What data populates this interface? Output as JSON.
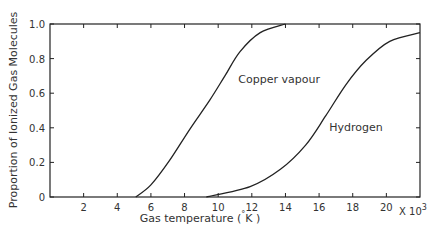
{
  "chart_data": {
    "type": "line",
    "title": "",
    "xlabel": "Gas temperature (°K)",
    "xlabel_parts": {
      "main": "Gas   temperature (",
      "degree": "°",
      "unit": "K )"
    },
    "x_multiplier": "X 10",
    "x_multiplier_exp": "3",
    "ylabel": "Proportion of Ionized Gas Molecules",
    "xlim": [
      0,
      22
    ],
    "ylim": [
      0,
      1.0
    ],
    "x_ticks": [
      2,
      4,
      6,
      8,
      10,
      12,
      14,
      16,
      18,
      20
    ],
    "x_tick_labels": [
      "2",
      "4",
      "6",
      "8",
      "10",
      "12",
      "14",
      "16",
      "18",
      "20"
    ],
    "y_ticks": [
      0,
      0.2,
      0.4,
      0.6,
      0.8,
      1.0
    ],
    "y_tick_labels": [
      "0",
      "0.2",
      "0.4",
      "0.6",
      "0.8",
      "1.0"
    ],
    "grid": false,
    "legend": "inline labels",
    "series": [
      {
        "name": "Copper vapour",
        "label_pos": {
          "x": 11.2,
          "y": 0.66
        },
        "x": [
          5.1,
          6.0,
          7.1,
          8.3,
          9.5,
          10.4,
          11.3,
          12.5,
          14.0
        ],
        "y": [
          0.0,
          0.07,
          0.21,
          0.39,
          0.56,
          0.7,
          0.84,
          0.95,
          1.0
        ]
      },
      {
        "name": "Hydrogen",
        "label_pos": {
          "x": 16.6,
          "y": 0.38
        },
        "x": [
          9.3,
          11.9,
          13.7,
          15.2,
          16.4,
          17.6,
          18.8,
          20.2,
          22.0
        ],
        "y": [
          0.0,
          0.06,
          0.16,
          0.3,
          0.47,
          0.65,
          0.79,
          0.9,
          0.95
        ]
      }
    ]
  }
}
